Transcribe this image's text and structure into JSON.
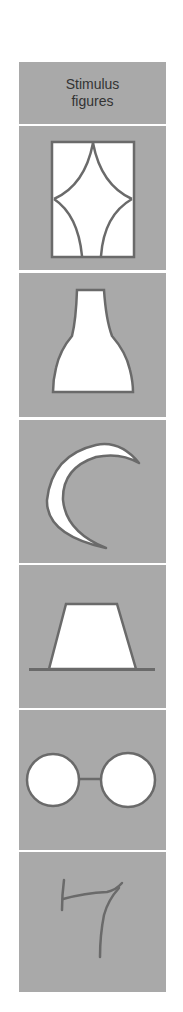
{
  "table": {
    "header": {
      "line1": "Stimulus",
      "line2": "figures"
    },
    "figures": [
      {
        "id": "window",
        "label": "window-figure"
      },
      {
        "id": "bottle",
        "label": "bottle-figure"
      },
      {
        "id": "crescent",
        "label": "crescent-figure"
      },
      {
        "id": "trapezoid",
        "label": "trapezoid-on-line-figure"
      },
      {
        "id": "eyeglasses",
        "label": "two-circles-connected-figure"
      },
      {
        "id": "seven",
        "label": "handwritten-seven-figure"
      }
    ]
  },
  "colors": {
    "cell_bg": "#a9a9a9",
    "stroke": "#6a6a6a",
    "fill": "#ffffff",
    "text": "#333333"
  }
}
